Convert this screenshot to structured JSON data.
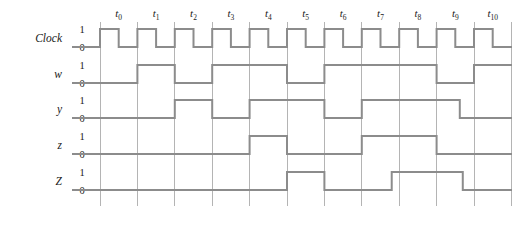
{
  "figure": {
    "kind": "digital-timing-diagram",
    "background_color": "#ffffff",
    "wave_color": "#8c8c8c",
    "grid_color": "#b4b4b4",
    "text_color": "#1a1a1a"
  },
  "time_axis": {
    "labels": [
      "t0",
      "t1",
      "t2",
      "t3",
      "t4",
      "t5",
      "t6",
      "t7",
      "t8",
      "t9",
      "t10"
    ],
    "label_base": "t",
    "subscripts": [
      "0",
      "1",
      "2",
      "3",
      "4",
      "5",
      "6",
      "7",
      "8",
      "9",
      "10"
    ],
    "grid_start_x": 100,
    "grid_spacing": 37.4,
    "grid_count": 12,
    "grid_top": 22,
    "grid_bottom": 206
  },
  "level_labels": {
    "high": "1",
    "low": "0"
  },
  "signals": [
    {
      "name": "Clock",
      "row_index": 0,
      "y_high": 29,
      "y_low": 47,
      "start_level": 0,
      "transitions": [
        0,
        0.5,
        1,
        1.5,
        2,
        2.5,
        3,
        3.5,
        4,
        4.5,
        5,
        5.5,
        6,
        6.5,
        7,
        7.5,
        8,
        8.5,
        9,
        9.5,
        10,
        10.5
      ],
      "end_level": 1
    },
    {
      "name": "w",
      "row_index": 1,
      "y_high": 65,
      "y_low": 83,
      "start_level": 0,
      "transitions": [
        1,
        2,
        3,
        5,
        6,
        9,
        10
      ],
      "end_level": 1
    },
    {
      "name": "y",
      "row_index": 2,
      "y_high": 100,
      "y_low": 118,
      "start_level": 0,
      "transitions": [
        2,
        3,
        4,
        6,
        7,
        9.62
      ],
      "end_level": 0
    },
    {
      "name": "z",
      "row_index": 3,
      "y_high": 136,
      "y_low": 154,
      "start_level": 0,
      "transitions": [
        4,
        5,
        7,
        9
      ],
      "end_level": 0
    },
    {
      "name": "Z",
      "row_index": 4,
      "y_high": 172,
      "y_low": 190,
      "start_level": 0,
      "transitions": [
        5,
        6,
        7.8,
        9.7
      ],
      "end_level": 0
    }
  ],
  "geometry": {
    "wave_left_x": 72,
    "wave_right_x": 512,
    "name_label_x": 62,
    "level_label_x": 82,
    "tick_label_y": 17
  }
}
